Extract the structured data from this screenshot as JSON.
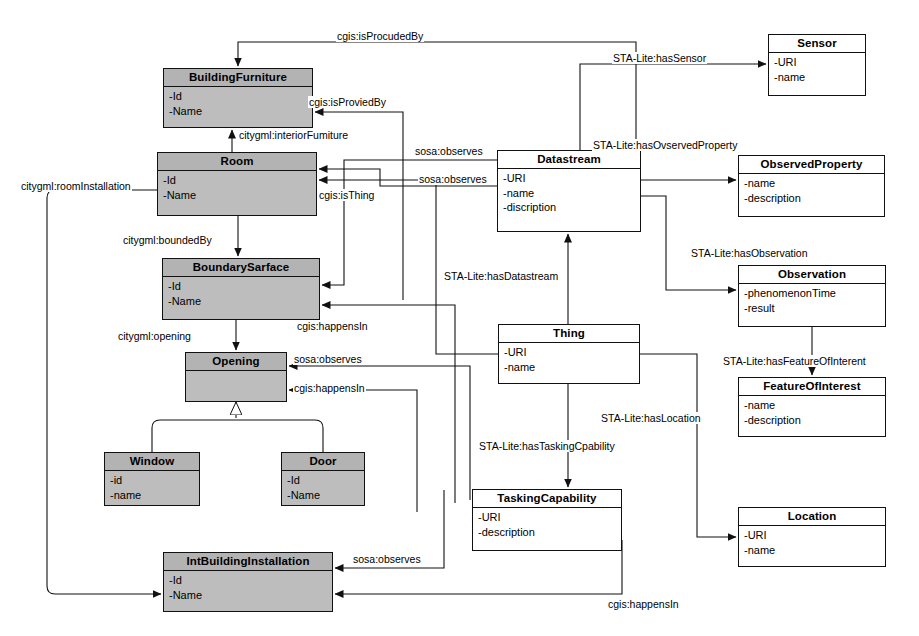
{
  "diagram": {
    "kind": "uml-class-diagram",
    "palette": {
      "shaded_fill": "#bdbdbd",
      "plain_fill": "#ffffff",
      "stroke": "#111111"
    }
  },
  "classes": [
    {
      "id": "buildingfurniture",
      "name": "BuildingFurniture",
      "shaded": true,
      "attrs": [
        "-Id",
        "-Name"
      ],
      "x": 163,
      "y": 68,
      "w": 150,
      "h": 60
    },
    {
      "id": "room",
      "name": "Room",
      "shaded": true,
      "attrs": [
        "-Id",
        "-Name"
      ],
      "x": 157,
      "y": 152,
      "w": 160,
      "h": 64
    },
    {
      "id": "boundarysarface",
      "name": "BoundarySarface",
      "shaded": true,
      "attrs": [
        "-Id",
        "-Name"
      ],
      "x": 162,
      "y": 258,
      "w": 158,
      "h": 62
    },
    {
      "id": "opening",
      "name": "Opening",
      "shaded": true,
      "attrs": [],
      "x": 185,
      "y": 352,
      "w": 102,
      "h": 50
    },
    {
      "id": "window",
      "name": "Window",
      "shaded": true,
      "attrs": [
        "-id",
        "-name"
      ],
      "x": 104,
      "y": 452,
      "w": 96,
      "h": 54
    },
    {
      "id": "door",
      "name": "Door",
      "shaded": true,
      "attrs": [
        "-Id",
        "-Name"
      ],
      "x": 281,
      "y": 452,
      "w": 84,
      "h": 54
    },
    {
      "id": "intbuildinginstallation",
      "name": "IntBuildingInstallation",
      "shaded": true,
      "attrs": [
        "-Id",
        "-Name"
      ],
      "x": 163,
      "y": 552,
      "w": 170,
      "h": 60
    },
    {
      "id": "datastream",
      "name": "Datastream",
      "shaded": false,
      "attrs": [
        "-URI",
        "-name",
        "-discription"
      ],
      "x": 497,
      "y": 150,
      "w": 144,
      "h": 82
    },
    {
      "id": "thing",
      "name": "Thing",
      "shaded": false,
      "attrs": [
        "-URI",
        "-name"
      ],
      "x": 498,
      "y": 324,
      "w": 142,
      "h": 60
    },
    {
      "id": "taskingcapability",
      "name": "TaskingCapability",
      "shaded": false,
      "attrs": [
        "-URI",
        "-description"
      ],
      "x": 472,
      "y": 489,
      "w": 150,
      "h": 62
    },
    {
      "id": "sensor",
      "name": "Sensor",
      "shaded": false,
      "attrs": [
        "-URI",
        "-name"
      ],
      "x": 768,
      "y": 34,
      "w": 98,
      "h": 62
    },
    {
      "id": "observedproperty",
      "name": "ObservedProperty",
      "shaded": false,
      "attrs": [
        "-name",
        "-description"
      ],
      "x": 738,
      "y": 155,
      "w": 147,
      "h": 62
    },
    {
      "id": "observation",
      "name": "Observation",
      "shaded": false,
      "attrs": [
        "-phenomenonTime",
        "-result"
      ],
      "x": 738,
      "y": 265,
      "w": 148,
      "h": 62
    },
    {
      "id": "featureofinterest",
      "name": "FeatureOfInterest",
      "shaded": false,
      "attrs": [
        "-name",
        "-description"
      ],
      "x": 738,
      "y": 377,
      "w": 148,
      "h": 60
    },
    {
      "id": "location",
      "name": "Location",
      "shaded": false,
      "attrs": [
        "-URI",
        "-name"
      ],
      "x": 738,
      "y": 507,
      "w": 148,
      "h": 60
    }
  ],
  "edge_labels": [
    {
      "id": "isprocudedby",
      "text": "cgis:isProcudedBy",
      "x": 336,
      "y": 30
    },
    {
      "id": "hassensor",
      "text": "STA-Lite:hasSensor",
      "x": 612,
      "y": 52
    },
    {
      "id": "isproviedby",
      "text": "cgis:isProviedBy",
      "x": 308,
      "y": 96
    },
    {
      "id": "interiorfurniture",
      "text": "citygml:interiorFumiture",
      "x": 238,
      "y": 129
    },
    {
      "id": "sosaobserves-1",
      "text": "sosa:observes",
      "x": 414,
      "y": 145
    },
    {
      "id": "hasovservedproperty",
      "text": "STA-Lite:hasOvservedProperty",
      "x": 592,
      "y": 139
    },
    {
      "id": "roominstallation",
      "text": "citygml:roomInstallation",
      "x": 20,
      "y": 180
    },
    {
      "id": "sosaobserves-2",
      "text": "sosa:observes",
      "x": 418,
      "y": 173
    },
    {
      "id": "isthing",
      "text": "cgis:isThing",
      "x": 318,
      "y": 189
    },
    {
      "id": "boundedby",
      "text": "citygml:boundedBy",
      "x": 122,
      "y": 234
    },
    {
      "id": "hasobservation",
      "text": "STA-Lite:hasObservation",
      "x": 690,
      "y": 247
    },
    {
      "id": "hasdatastream",
      "text": "STA-Lite:hasDatastream",
      "x": 443,
      "y": 270
    },
    {
      "id": "opening-assoc",
      "text": "citygml:opening",
      "x": 117,
      "y": 330
    },
    {
      "id": "happensin-1",
      "text": "cgis:happensIn",
      "x": 296,
      "y": 320
    },
    {
      "id": "sosaobserves-3",
      "text": "sosa:observes",
      "x": 293,
      "y": 353
    },
    {
      "id": "hasfeatureofinterent",
      "text": "STA-Lite:hasFeatureOfInterent",
      "x": 722,
      "y": 355
    },
    {
      "id": "happensin-2",
      "text": "cgis:happensIn",
      "x": 293,
      "y": 382
    },
    {
      "id": "haslocation",
      "text": "STA-Lite:hasLocation",
      "x": 600,
      "y": 412
    },
    {
      "id": "hastaskingcpability",
      "text": "STA-Lite:hasTaskingCpability",
      "x": 478,
      "y": 440
    },
    {
      "id": "sosaobserves-4",
      "text": "sosa:observes",
      "x": 352,
      "y": 553
    },
    {
      "id": "happensin-3",
      "text": "cgis:happensIn",
      "x": 607,
      "y": 598
    }
  ]
}
